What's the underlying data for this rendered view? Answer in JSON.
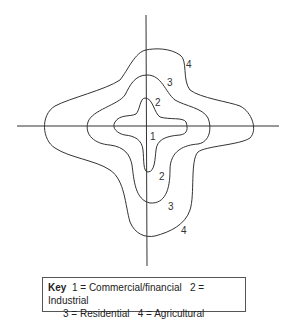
{
  "diagram": {
    "zone_labels": {
      "z1": "1",
      "z2_top": "2",
      "z2_bottom": "2",
      "z3_top": "3",
      "z3_bottom": "3",
      "z4_top": "4",
      "z4_bottom": "4"
    }
  },
  "key": {
    "title": "Key",
    "items": [
      {
        "text": "1 = Commercial/financial"
      },
      {
        "text": "2 = Industrial"
      },
      {
        "text": "3 = Residential"
      },
      {
        "text": "4 = Agricultural"
      }
    ]
  }
}
